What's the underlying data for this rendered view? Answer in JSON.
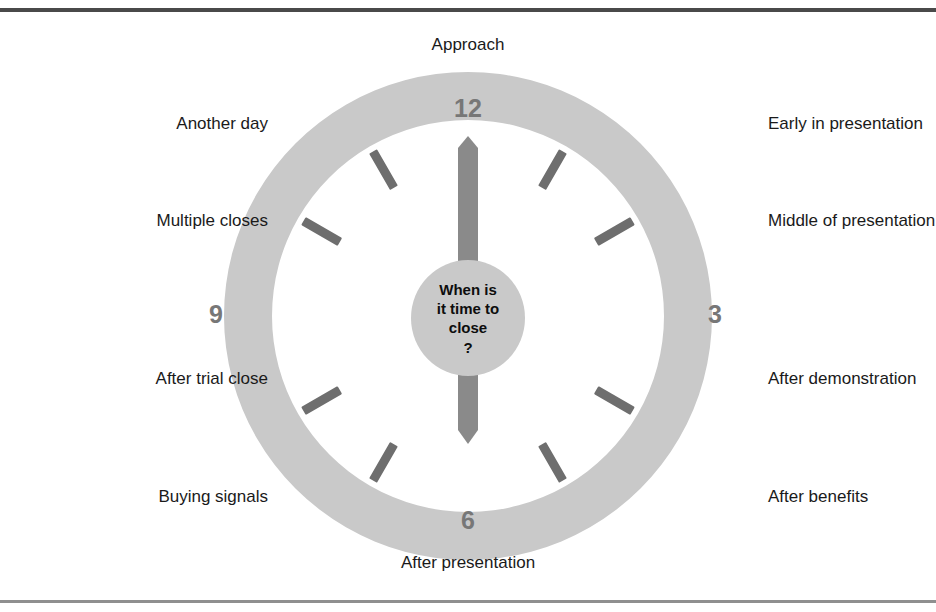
{
  "figure": {
    "type": "clock-diagram",
    "title_question": {
      "lines": [
        "When is",
        "it time to",
        "close",
        "?"
      ]
    },
    "colors": {
      "ring": "#c9c9c9",
      "hub": "#c9c9c9",
      "tick": "#6e6e6e",
      "hand": "#8a8a8a",
      "numeral": "#777777",
      "label_text": "#1a1a1a",
      "rule_top": "#4a4a4a",
      "rule_bottom": "#8f8f8f",
      "background": "#ffffff"
    },
    "numerals": [
      {
        "value": "12",
        "position": "top"
      },
      {
        "value": "3",
        "position": "right"
      },
      {
        "value": "6",
        "position": "bottom"
      },
      {
        "value": "9",
        "position": "left"
      }
    ],
    "hands": [
      {
        "name": "minute-hand",
        "points": "up",
        "target_numeral": "12"
      },
      {
        "name": "hour-hand",
        "points": "down",
        "target_numeral": "6"
      }
    ],
    "tick_count": 8,
    "labels": [
      {
        "id": "approach",
        "text": "Approach",
        "hour": 12,
        "align": "center"
      },
      {
        "id": "early-in-presentation",
        "text": "Early in presentation",
        "hour": 1,
        "align": "left"
      },
      {
        "id": "middle-of-presentation",
        "text": "Middle of presentation",
        "hour": 2,
        "align": "left"
      },
      {
        "id": "after-demonstration",
        "text": "After demonstration",
        "hour": 4,
        "align": "left"
      },
      {
        "id": "after-benefits",
        "text": "After benefits",
        "hour": 5,
        "align": "left"
      },
      {
        "id": "after-presentation",
        "text": "After presentation",
        "hour": 6,
        "align": "center"
      },
      {
        "id": "buying-signals",
        "text": "Buying signals",
        "hour": 7,
        "align": "right"
      },
      {
        "id": "after-trial-close",
        "text": "After trial close",
        "hour": 8,
        "align": "right"
      },
      {
        "id": "multiple-closes",
        "text": "Multiple closes",
        "hour": 10,
        "align": "right"
      },
      {
        "id": "another-day",
        "text": "Another day",
        "hour": 11,
        "align": "right"
      }
    ]
  }
}
